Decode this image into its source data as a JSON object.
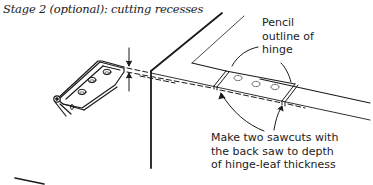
{
  "figure": {
    "title": "Stage 2 (optional): cutting recesses",
    "annotations": {
      "pencil_outline": "Pencil\noutline of\nhinge",
      "sawcuts": "Make two sawcuts with\nthe back saw to depth\nof hinge-leaf thickness"
    },
    "colors": {
      "ink": "#1a1a1a",
      "background": "#ffffff"
    }
  }
}
